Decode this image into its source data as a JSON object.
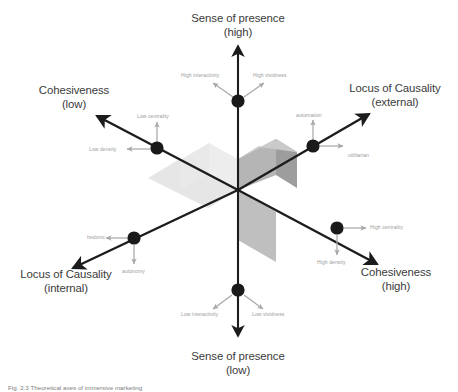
{
  "figure": {
    "caption": "Fig. 2.3  Theoretical axes of immersive marketing"
  },
  "axes": {
    "top": {
      "name": "Sense of presence",
      "level": "(high)"
    },
    "bottom": {
      "name": "Sense of presence",
      "level": "(low)"
    },
    "upper_left": {
      "name": "Cohesiveness",
      "level": "(low)"
    },
    "upper_right": {
      "name": "Locus of Causality",
      "level": "(external)"
    },
    "lower_left": {
      "name": "Locus of Causality",
      "level": "(internal)"
    },
    "lower_right": {
      "name": "Cohesiveness",
      "level": "(high)"
    }
  },
  "nodes": [
    {
      "id": "node-top",
      "labels": [
        "High interactivity",
        "High vividness"
      ]
    },
    {
      "id": "node-upper-left",
      "labels": [
        "Low centrality",
        "Low density"
      ]
    },
    {
      "id": "node-upper-right",
      "labels": [
        "automation",
        "utilitarian"
      ]
    },
    {
      "id": "node-lower-left",
      "labels": [
        "hedonic",
        "autonomy"
      ]
    },
    {
      "id": "node-lower-right",
      "labels": [
        "High centrality",
        "High density"
      ]
    },
    {
      "id": "node-bottom",
      "labels": [
        "Low interactivity",
        "Low vividness"
      ]
    }
  ],
  "sub_labels": {
    "high_interactivity": "High interactivity",
    "high_vividness": "High vividness",
    "low_centrality": "Low centrality",
    "low_density": "Low density",
    "automation": "automation",
    "utilitarian": "utilitarian",
    "hedonic": "hedonic",
    "autonomy": "autonomy",
    "high_centrality": "High centrality",
    "high_density": "High density",
    "low_interactivity": "Low interactivity",
    "low_vividness": "Low vividness"
  },
  "colors": {
    "axis": "#1c1c1c",
    "node": "#1a1a1a",
    "small_text": "#9b9b9b",
    "axis_text": "#3b3b3b",
    "cube_top": "#c9c9c9",
    "cube_front": "#b2b2b2",
    "cube_side": "#9f9f9f",
    "plane_light": "#e3e3e3",
    "plane_mid": "#ededed",
    "plane_dark": "#bdbdbd",
    "background": "#ffffff"
  },
  "geometry": {
    "origin": {
      "x": 238,
      "y": 190
    },
    "note": "3D isometric coordinate system with vertical presence axis and two diagonal axes"
  }
}
